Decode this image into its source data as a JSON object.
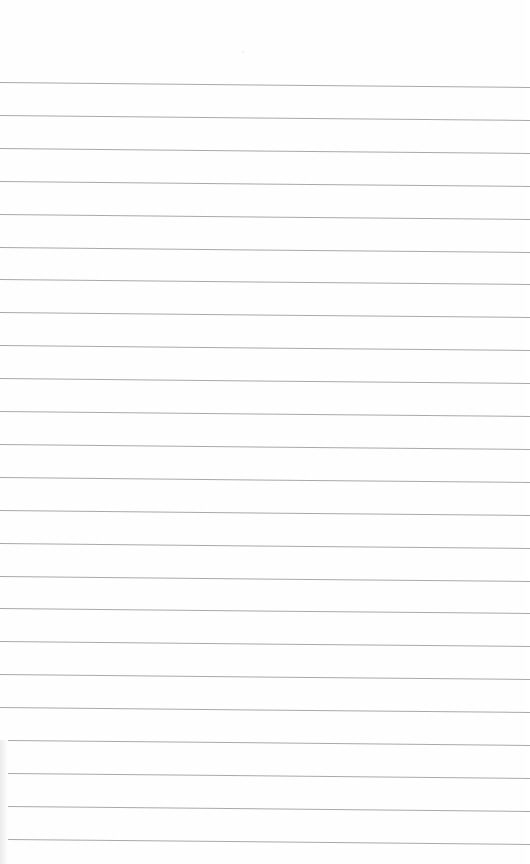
{
  "page": {
    "type": "blank lined paper",
    "background_color": "#fefefe",
    "rule_color": "#9a9a9a",
    "text": ""
  },
  "rules": {
    "count": 24,
    "first_y_left": 82,
    "spacing": 32.9,
    "slope_px_across_width": 5,
    "start_x_top": 0,
    "start_x_bottom": 8,
    "end_x": 526
  }
}
